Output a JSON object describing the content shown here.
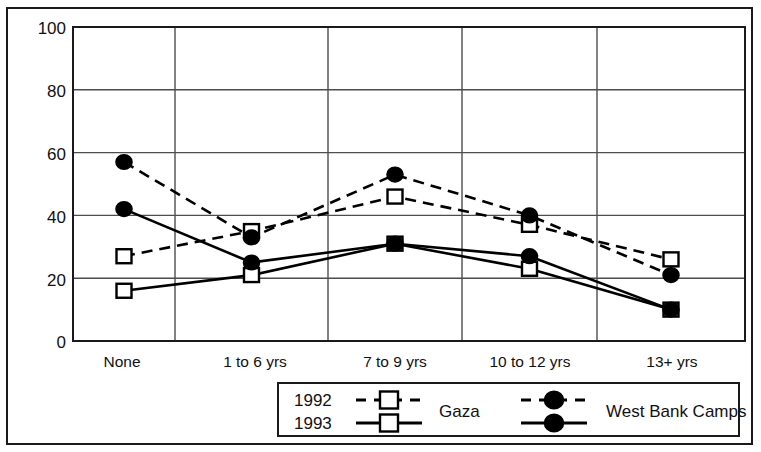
{
  "chart_data": {
    "type": "line",
    "title": "",
    "subtitle": "",
    "xlabel": "",
    "ylabel": "",
    "categories": [
      "None",
      "1 to 6 yrs",
      "7 to 9 yrs",
      "10 to 12 yrs",
      "13+ yrs"
    ],
    "ylim": [
      0,
      100
    ],
    "yticks": [
      0,
      20,
      40,
      60,
      80,
      100
    ],
    "ytick_labels": [
      "0",
      "20",
      "40",
      "60",
      "80",
      "100"
    ],
    "grid": true,
    "grid_axes": "both",
    "legend_position": "bottom",
    "series": [
      {
        "name": "1992 Gaza",
        "year": "1992",
        "group": "Gaza",
        "line_style": "dashed",
        "marker": "open-square",
        "color": "#000000",
        "values": [
          27,
          35,
          46,
          37,
          26
        ]
      },
      {
        "name": "1992 West Bank Camps",
        "year": "1992",
        "group": "West Bank Camps",
        "line_style": "dashed",
        "marker": "filled-circle",
        "color": "#000000",
        "values": [
          57,
          33,
          53,
          40,
          21
        ]
      },
      {
        "name": "1993 Gaza",
        "year": "1993",
        "group": "Gaza",
        "line_style": "solid",
        "marker": "open-square",
        "color": "#000000",
        "values": [
          16,
          21,
          31,
          23,
          10
        ]
      },
      {
        "name": "1993 West Bank Camps",
        "year": "1993",
        "group": "West Bank Camps",
        "line_style": "solid",
        "marker": "filled-circle",
        "color": "#000000",
        "values": [
          42,
          25,
          31,
          27,
          10
        ]
      }
    ]
  },
  "legend": {
    "rows": [
      {
        "year_label": "1992",
        "line_style": "dashed"
      },
      {
        "year_label": "1993",
        "line_style": "solid"
      }
    ],
    "groups": [
      {
        "label": "Gaza",
        "marker": "open-square"
      },
      {
        "label": "West Bank Camps",
        "marker": "filled-circle"
      }
    ]
  },
  "colors": {
    "line": "#000000",
    "grid": "#4d4d4d",
    "axis": "#1a1a1a",
    "frame": "#1a1a1a",
    "background": "#ffffff",
    "marker_fill_open": "#ffffff",
    "marker_fill_solid": "#000000"
  }
}
